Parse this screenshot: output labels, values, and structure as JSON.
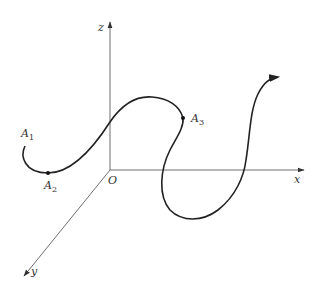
{
  "figure": {
    "axes": {
      "origin_label": "O",
      "x_label": "x",
      "y_label": "y",
      "z_label": "z"
    },
    "points": [
      {
        "name": "A",
        "sub": "1"
      },
      {
        "name": "A",
        "sub": "2"
      },
      {
        "name": "A",
        "sub": "3"
      }
    ],
    "colors": {
      "axis": "#6e6e6e",
      "curve": "#222222",
      "text": "#333333"
    }
  }
}
